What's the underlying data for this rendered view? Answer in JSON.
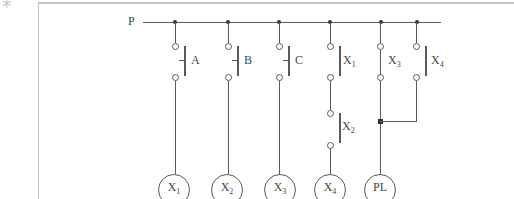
{
  "page": {
    "corner_mark": "*"
  },
  "colors": {
    "line": "#5a5a5a",
    "text": "#454545",
    "node": "#333333",
    "border": "#c5c5c5",
    "mark": "#c9c9c9"
  },
  "diagram": {
    "type": "relay-ladder-circuit",
    "bus_label": "P",
    "contacts": {
      "a": {
        "base": "A",
        "sub": ""
      },
      "b": {
        "base": "B",
        "sub": ""
      },
      "c": {
        "base": "C",
        "sub": ""
      },
      "x1": {
        "base": "X",
        "sub": "1"
      },
      "x2": {
        "base": "X",
        "sub": "2"
      },
      "x3": {
        "base": "X",
        "sub": "3"
      },
      "x4": {
        "base": "X",
        "sub": "4"
      }
    },
    "coils": {
      "x1": {
        "base": "X",
        "sub": "1"
      },
      "x2": {
        "base": "X",
        "sub": "2"
      },
      "x3": {
        "base": "X",
        "sub": "3"
      },
      "x4": {
        "base": "X",
        "sub": "4"
      },
      "pl": {
        "base": "PL",
        "sub": ""
      }
    }
  }
}
